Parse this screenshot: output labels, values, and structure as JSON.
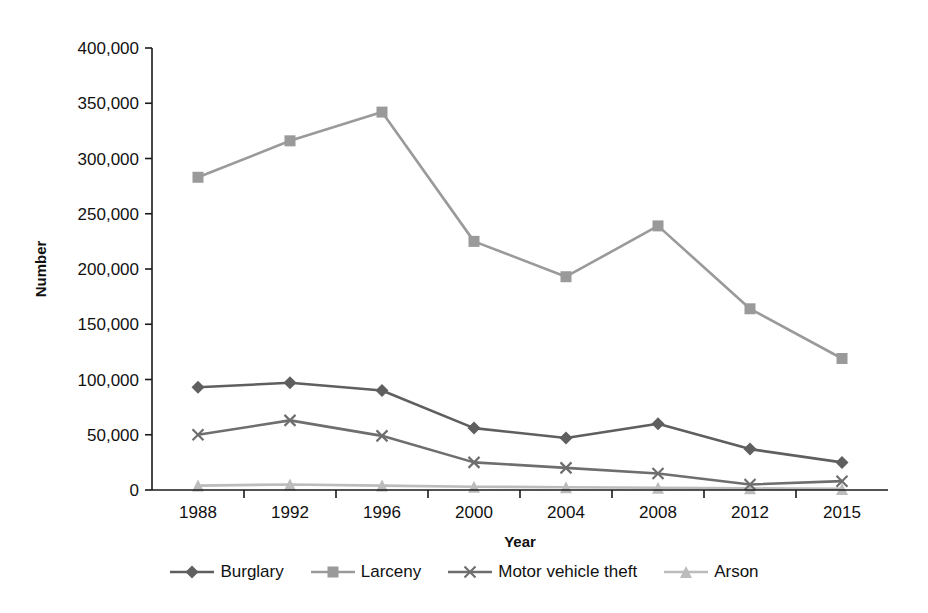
{
  "chart_data": {
    "type": "line",
    "title": "",
    "xlabel": "Year",
    "ylabel": "Number",
    "categories": [
      "1988",
      "1992",
      "1996",
      "2000",
      "2004",
      "2008",
      "2012",
      "2015"
    ],
    "ylim": [
      0,
      400000
    ],
    "yticks": [
      0,
      50000,
      100000,
      150000,
      200000,
      250000,
      300000,
      350000,
      400000
    ],
    "ytick_labels": [
      "0",
      "50,000",
      "100,000",
      "150,000",
      "200,000",
      "250,000",
      "300,000",
      "350,000",
      "400,000"
    ],
    "grid": false,
    "legend_position": "bottom",
    "series": [
      {
        "name": "Burglary",
        "marker": "diamond",
        "color": "#5f5f5f",
        "values": [
          93000,
          97000,
          90000,
          56000,
          47000,
          60000,
          37000,
          25000
        ]
      },
      {
        "name": "Larceny",
        "marker": "square",
        "color": "#9a9a9a",
        "values": [
          283000,
          316000,
          342000,
          225000,
          193000,
          239000,
          164000,
          119000
        ]
      },
      {
        "name": "Motor vehicle theft",
        "marker": "x",
        "color": "#6e6e6e",
        "values": [
          50000,
          63000,
          49000,
          25000,
          20000,
          15000,
          5000,
          8000
        ]
      },
      {
        "name": "Arson",
        "marker": "triangle",
        "color": "#bcbcbc",
        "values": [
          4000,
          5000,
          4000,
          3000,
          2500,
          2000,
          1500,
          1000
        ]
      }
    ]
  },
  "axis": {
    "y_title": "Number",
    "x_title": "Year"
  },
  "legend": {
    "items": [
      {
        "label": "Burglary"
      },
      {
        "label": "Larceny"
      },
      {
        "label": "Motor vehicle theft"
      },
      {
        "label": "Arson"
      }
    ]
  }
}
